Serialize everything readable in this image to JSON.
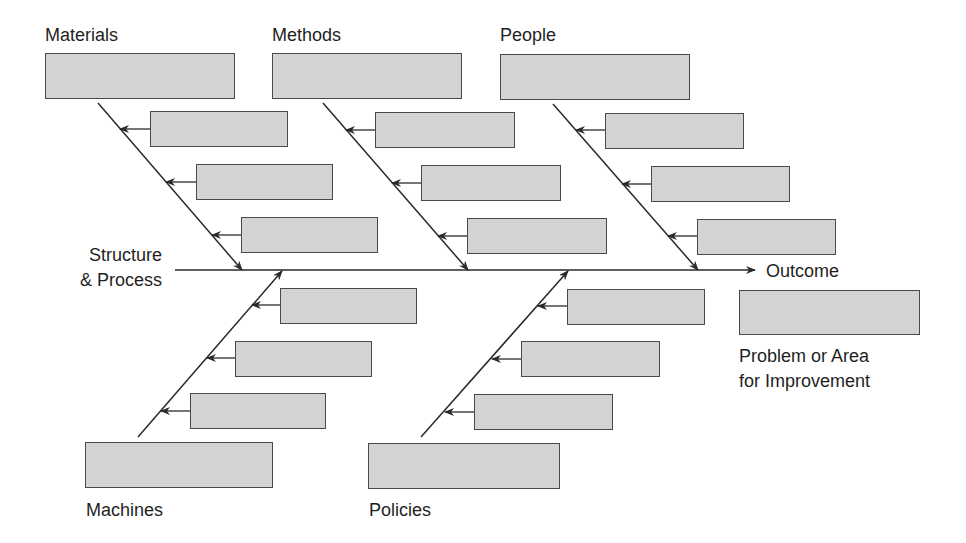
{
  "diagram": {
    "type": "fishbone (Ishikawa) cause-and-effect diagram",
    "spine": {
      "label_line1": "Structure",
      "label_line2": "& Process",
      "arrow_label": "Outcome"
    },
    "effect": {
      "caption_line1": "Problem or Area",
      "caption_line2": "for Improvement"
    },
    "colors": {
      "box_fill": "#d3d3d3",
      "box_border": "#4a4a4a",
      "line": "#2a2a2a",
      "background": "#ffffff"
    },
    "categories": [
      {
        "id": "materials",
        "label": "Materials",
        "position": "top",
        "cause_boxes": 3
      },
      {
        "id": "methods",
        "label": "Methods",
        "position": "top",
        "cause_boxes": 3
      },
      {
        "id": "people",
        "label": "People",
        "position": "top",
        "cause_boxes": 3
      },
      {
        "id": "machines",
        "label": "Machines",
        "position": "bottom",
        "cause_boxes": 3
      },
      {
        "id": "policies",
        "label": "Policies",
        "position": "bottom",
        "cause_boxes": 3
      }
    ]
  }
}
